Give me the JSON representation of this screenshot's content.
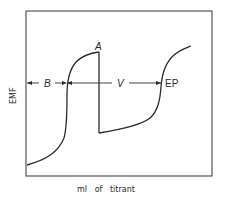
{
  "diagram": {
    "type": "potentiometric-titration-curve",
    "y_axis_label": "EMF",
    "x_axis_label": "ml   of   titrant",
    "points": {
      "A": "A",
      "EP": "EP"
    },
    "intervals": {
      "B": "B",
      "V": "V"
    },
    "colors": {
      "line": "#2a2a2a",
      "frame": "#555555",
      "background": "#ffffff"
    }
  }
}
